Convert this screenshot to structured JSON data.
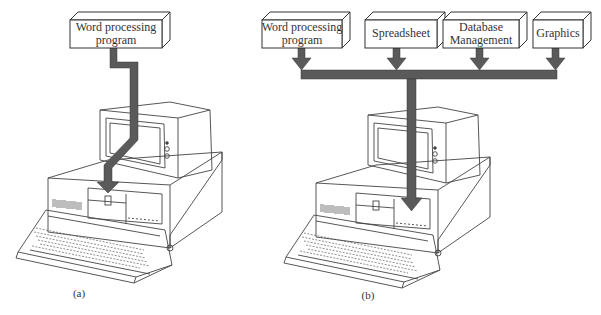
{
  "panel_a": {
    "caption": "(a)",
    "program_box": {
      "line1": "Word processing",
      "line2": "program"
    }
  },
  "panel_b": {
    "caption": "(b)",
    "program_boxes": [
      {
        "line1": "Word processing",
        "line2": "program"
      },
      {
        "line1": "Spreadsheet",
        "line2": ""
      },
      {
        "line1": "Database",
        "line2": "Management"
      },
      {
        "line1": "Graphics",
        "line2": ""
      }
    ]
  },
  "colors": {
    "arrow": "#5a5a5a",
    "line": "#444444",
    "box_fill": "#ffffff"
  }
}
